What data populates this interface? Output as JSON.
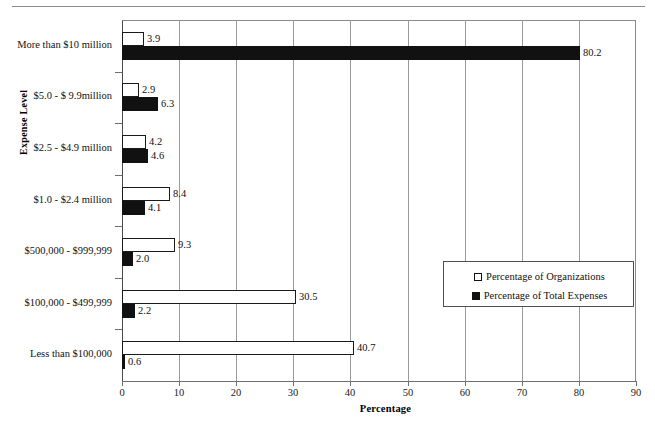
{
  "chart_data": {
    "type": "bar",
    "orientation": "horizontal",
    "title": "",
    "xlabel": "Percentage",
    "ylabel": "Expense Level",
    "xlim": [
      0,
      90
    ],
    "xticks": [
      0,
      10,
      20,
      30,
      40,
      50,
      60,
      70,
      80,
      90
    ],
    "grid": true,
    "grid_axis": "x",
    "legend_position": "center-right",
    "categories": [
      "More than $10 million",
      "$5.0 - $ 9.9million",
      "$2.5 - $4.9 million",
      "$1.0 - $2.4 million",
      "$500,000 - $999,999",
      "$100,000 - $499,999",
      "Less than $100,000"
    ],
    "series": [
      {
        "name": "Percentage of Organizations",
        "color": "#ffffff",
        "edge_color": "#1a1a1a",
        "values": [
          3.9,
          2.9,
          4.2,
          8.4,
          9.3,
          30.5,
          40.7
        ]
      },
      {
        "name": "Percentage of Total Expenses",
        "color": "#111111",
        "edge_color": "#111111",
        "values": [
          80.2,
          6.3,
          4.6,
          4.1,
          2.0,
          2.2,
          0.6
        ]
      }
    ],
    "value_labels": {
      "orgs": [
        "3.9",
        "2.9",
        "4.2",
        "8.4",
        "9.3",
        "30.5",
        "40.7"
      ],
      "expenses": [
        "80.2",
        "6.3",
        "4.6",
        "4.1",
        "2.0",
        "2.2",
        "0.6"
      ]
    }
  },
  "legend": {
    "items": [
      {
        "label": "Percentage of Organizations",
        "marker": "hollow-square"
      },
      {
        "label": "Percentage of Total Expenses",
        "marker": "filled-square"
      }
    ]
  }
}
